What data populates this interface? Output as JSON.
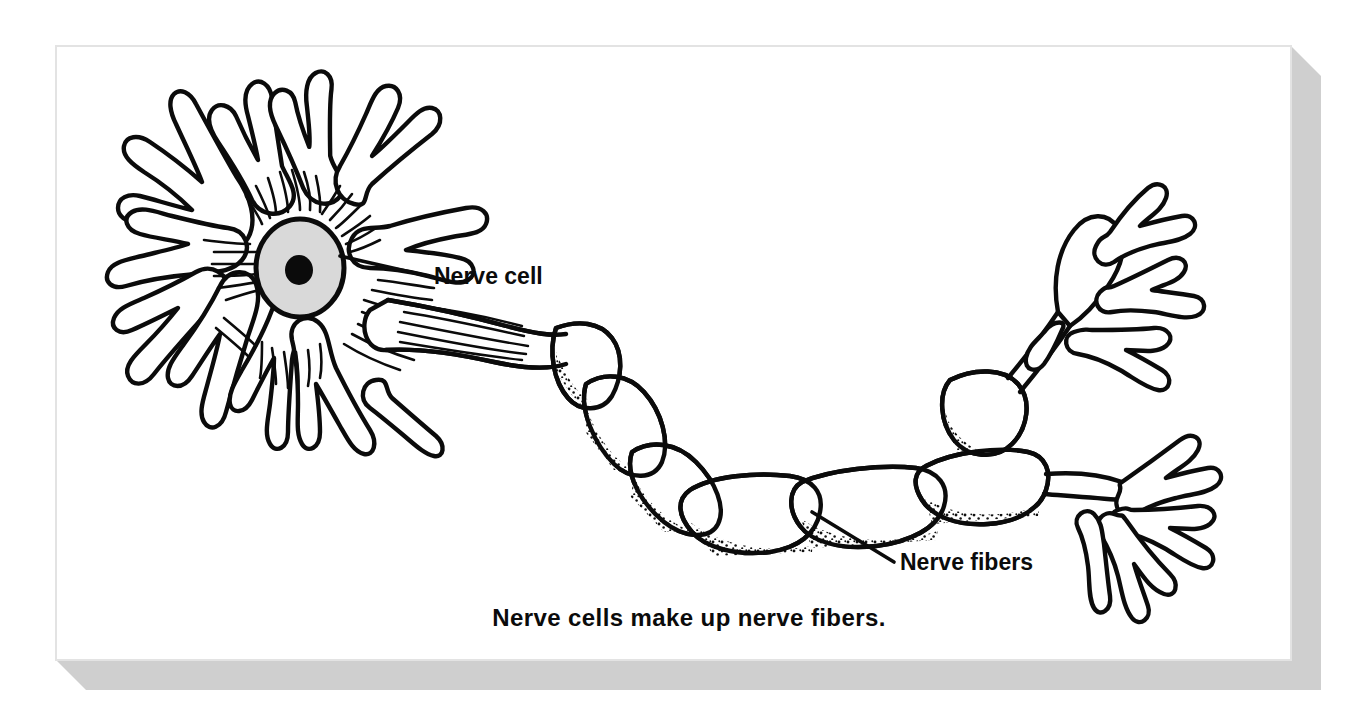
{
  "figure": {
    "caption": "Nerve cells make up nerve fibers.",
    "callouts": [
      {
        "name": "nerve-cell",
        "label": "Nerve cell"
      },
      {
        "name": "nerve-fibers",
        "label": "Nerve fibers"
      }
    ],
    "parts": [
      {
        "name": "cell-body",
        "label": "Nerve cell"
      },
      {
        "name": "nucleus",
        "label": "Nucleus"
      },
      {
        "name": "nucleolus",
        "label": "Nucleolus"
      },
      {
        "name": "dendrites",
        "label": "Dendrites"
      },
      {
        "name": "axon",
        "label": "Nerve fibers"
      },
      {
        "name": "myelin-segments",
        "label": "Myelin segments"
      },
      {
        "name": "terminal-branches",
        "label": "Terminal branches"
      }
    ],
    "colors": {
      "page_background": "#ffffff",
      "panel_background": "#ffffff",
      "panel_border": "#e3e3e3",
      "panel_shadow": "#cfcfcf",
      "ink": "#0b0b0b",
      "nucleus_fill": "#d9d9d9",
      "stipple": "#111111"
    }
  }
}
